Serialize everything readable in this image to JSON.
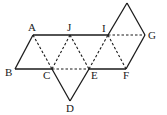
{
  "diagram": {
    "type": "geometric-net",
    "points": [
      {
        "name": "A"
      },
      {
        "name": "J"
      },
      {
        "name": "I"
      },
      {
        "name": "G"
      },
      {
        "name": "B"
      },
      {
        "name": "C"
      },
      {
        "name": "E"
      },
      {
        "name": "F"
      },
      {
        "name": "D"
      }
    ],
    "solid_edges": [
      [
        "B",
        "C"
      ],
      [
        "E",
        "F"
      ],
      [
        "A",
        "I"
      ],
      [
        "A",
        "B"
      ],
      [
        "C",
        "D"
      ],
      [
        "D",
        "E"
      ],
      [
        "I",
        "apex"
      ],
      [
        "apex",
        "G"
      ],
      [
        "G",
        "F"
      ]
    ],
    "dashed_edges": [
      [
        "A",
        "C"
      ],
      [
        "C",
        "J"
      ],
      [
        "J",
        "E"
      ],
      [
        "E",
        "I"
      ],
      [
        "I",
        "F"
      ],
      [
        "I",
        "G"
      ],
      [
        "C",
        "E"
      ]
    ],
    "labels": {
      "A": "A",
      "J": "J",
      "I": "I",
      "G": "G",
      "B": "B",
      "C": "C",
      "E": "E",
      "F": "F",
      "D": "D"
    }
  }
}
